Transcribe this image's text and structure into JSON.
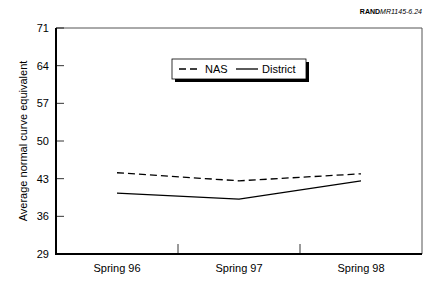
{
  "credit": {
    "brand": "RAND",
    "code": "MR1145-6.24"
  },
  "chart_data": {
    "type": "line",
    "title": "",
    "xlabel": "",
    "ylabel": "Average normal curve equivalent",
    "categories": [
      "Spring 96",
      "Spring 97",
      "Spring 98"
    ],
    "series": [
      {
        "name": "NAS",
        "style": "dashed",
        "values": [
          44.1,
          42.6,
          43.9
        ]
      },
      {
        "name": "District",
        "style": "solid",
        "values": [
          40.3,
          39.2,
          42.6
        ]
      }
    ],
    "ylim": [
      29,
      71
    ],
    "yticks": [
      29,
      36,
      43,
      50,
      57,
      64,
      71
    ],
    "grid": false,
    "legend_position": "top-center"
  }
}
